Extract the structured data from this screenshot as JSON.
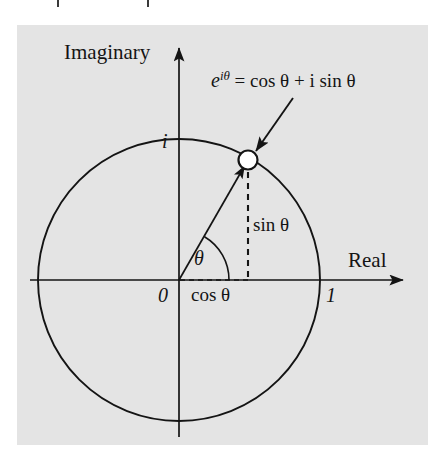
{
  "figure": {
    "type": "unit-circle-complex-plane",
    "panel_color": "#e4e4e4",
    "ink_color": "#141414",
    "axes": {
      "imaginary_label": "Imaginary",
      "real_label": "Real",
      "origin_label": "0",
      "imaginary_unit_label": "i",
      "real_unit_label": "1"
    },
    "annotations": {
      "equation_e": "e",
      "equation_exponent": "iθ",
      "equation_rest": " = cos θ + i sin θ",
      "equation_full": "e^{iθ} = cos θ + i sin θ",
      "angle_label": "θ",
      "cos_label": "cos θ",
      "sin_label": "sin θ"
    },
    "geometry": {
      "center_x": 179,
      "center_y": 280,
      "radius": 141,
      "point_x": 248,
      "point_y": 160,
      "point_angle_degrees": 60
    }
  },
  "scan_ticks": [
    {
      "x": 57
    },
    {
      "x": 147
    }
  ]
}
